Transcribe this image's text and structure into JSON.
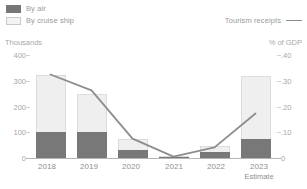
{
  "legend": {
    "series": [
      {
        "label": "By air",
        "icon": "square-swatch-dark",
        "color": "#787878"
      },
      {
        "label": "By cruise ship",
        "icon": "square-swatch-light",
        "color": "#efefef"
      }
    ],
    "line_entry": {
      "label": "Tourism receipts",
      "icon": "line-swatch",
      "color": "#8d8d8d"
    }
  },
  "axes": {
    "left_unit": "Thousands",
    "right_unit": "% of GDP",
    "left_ticks": [
      "400",
      "300",
      "200",
      "100",
      "0"
    ],
    "right_ticks": [
      ".40",
      ".30",
      ".20",
      ".10",
      "0"
    ]
  },
  "xaxis": {
    "labels": [
      {
        "year": "2018",
        "sub": ""
      },
      {
        "year": "2019",
        "sub": ""
      },
      {
        "year": "2020",
        "sub": ""
      },
      {
        "year": "2021",
        "sub": ""
      },
      {
        "year": "2022",
        "sub": ""
      },
      {
        "year": "2023",
        "sub": "Estimate"
      }
    ]
  },
  "chart_data": {
    "type": "bar",
    "title": "",
    "xlabel": "",
    "ylabel": "Thousands",
    "y2label": "% of GDP",
    "categories": [
      "2018",
      "2019",
      "2020",
      "2021",
      "2022",
      "2023"
    ],
    "ylim": [
      0,
      400
    ],
    "y2lim": [
      0,
      0.4
    ],
    "grid": false,
    "legend_position": "top",
    "stacked": true,
    "series": [
      {
        "name": "By air",
        "axis": "left",
        "color": "#787878",
        "values": [
          100,
          100,
          30,
          4,
          22,
          70
        ]
      },
      {
        "name": "By cruise ship",
        "axis": "left",
        "color": "#efefef",
        "values": [
          215,
          140,
          40,
          2,
          23,
          240
        ]
      },
      {
        "name": "Tourism receipts",
        "axis": "right",
        "type": "line",
        "color": "#8d8d8d",
        "values": [
          0.315,
          0.255,
          0.073,
          0.005,
          0.04,
          0.168
        ]
      }
    ],
    "totals": [
      315,
      240,
      70,
      6,
      45,
      310
    ]
  }
}
